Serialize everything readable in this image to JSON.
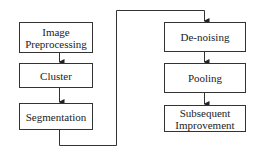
{
  "diagram": {
    "left_column": [
      {
        "label": "Image Preprocessing"
      },
      {
        "label": "Cluster"
      },
      {
        "label": "Segmentation"
      }
    ],
    "right_column": [
      {
        "label": "De-noising"
      },
      {
        "label": "Pooling"
      },
      {
        "label": "Subsequent Improvement"
      }
    ]
  }
}
